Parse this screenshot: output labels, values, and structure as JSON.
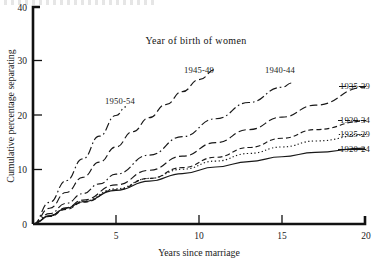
{
  "figure": {
    "title": "Year of birth of women",
    "xlabel": "Years since marriage",
    "ylabel": "Cumulative percentage separating"
  },
  "axes": {
    "x_ticks": [
      "5",
      "10",
      "15",
      "20"
    ],
    "y_ticks": [
      "10",
      "20",
      "30",
      "40"
    ],
    "origin_label": "0"
  },
  "labels": {
    "c1950": "1950-54",
    "c1945": "1945-49",
    "c1940": "1940-44",
    "c1935": "1935-39",
    "c1930": "1930-34",
    "c1925": "1925-29",
    "c1920": "1920-24"
  },
  "chart_data": {
    "type": "line",
    "title": "Year of birth of women",
    "xlabel": "Years since marriage",
    "ylabel": "Cumulative percentage separating",
    "xlim": [
      0,
      20
    ],
    "ylim": [
      0,
      40
    ],
    "x_ticks": [
      5,
      10,
      15,
      20
    ],
    "y_ticks": [
      10,
      20,
      30,
      40
    ],
    "grid": false,
    "legend": "inline-labels",
    "series": [
      {
        "name": "1950-54",
        "style": "dash-dot",
        "label_position": "inner-left",
        "x": [
          0,
          1,
          2,
          3,
          4,
          5,
          5.6
        ],
        "values": [
          0,
          4.0,
          8.0,
          12.0,
          16.2,
          20.0,
          21.6
        ]
      },
      {
        "name": "1945-49",
        "style": "long-dash",
        "label_position": "inner",
        "x": [
          0,
          1,
          2,
          3,
          4,
          5,
          6,
          7,
          8,
          9,
          10,
          11
        ],
        "values": [
          0,
          2.9,
          5.8,
          8.6,
          11.4,
          14.2,
          17.0,
          19.6,
          22.0,
          24.4,
          26.6,
          28.5
        ]
      },
      {
        "name": "1940-44",
        "style": "dash-dot",
        "label_position": "inner",
        "x": [
          0,
          1,
          2,
          3,
          4,
          5,
          7,
          9,
          11,
          13,
          15,
          15.6
        ],
        "values": [
          0,
          1.9,
          3.8,
          5.6,
          7.4,
          9.2,
          12.7,
          16.1,
          19.4,
          22.4,
          25.2,
          26.0
        ]
      },
      {
        "name": "1935-39",
        "style": "long-dash",
        "label_position": "right",
        "x": [
          0,
          1,
          2,
          3,
          5,
          7,
          9,
          11,
          13,
          15,
          17,
          20
        ],
        "values": [
          0,
          1.5,
          3.0,
          4.4,
          7.2,
          9.9,
          12.5,
          15.0,
          17.4,
          19.7,
          21.9,
          25.2
        ]
      },
      {
        "name": "1930-34",
        "style": "dashed",
        "label_position": "right",
        "x": [
          0,
          1,
          2,
          3,
          5,
          7,
          9,
          11,
          13,
          15,
          17,
          20
        ],
        "values": [
          0,
          1.4,
          2.7,
          4.0,
          6.3,
          8.4,
          10.4,
          12.3,
          14.1,
          15.8,
          17.4,
          19.0
        ]
      },
      {
        "name": "1925-29",
        "style": "dotted",
        "label_position": "right",
        "x": [
          0,
          1,
          2,
          3,
          5,
          7,
          9,
          11,
          13,
          15,
          17,
          20
        ],
        "values": [
          0,
          1.5,
          2.9,
          4.2,
          6.5,
          8.4,
          10.1,
          11.6,
          13.0,
          14.2,
          15.3,
          16.4
        ]
      },
      {
        "name": "1920-24",
        "style": "solid",
        "label_position": "right",
        "x": [
          0,
          1,
          2,
          3,
          5,
          7,
          9,
          11,
          13,
          15,
          17,
          20
        ],
        "values": [
          0,
          1.5,
          2.9,
          4.1,
          6.2,
          7.9,
          9.3,
          10.5,
          11.5,
          12.4,
          13.2,
          14.0
        ]
      }
    ]
  }
}
